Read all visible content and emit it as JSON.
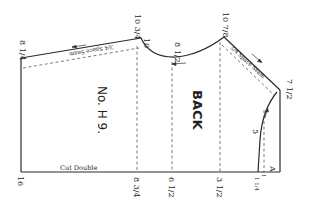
{
  "diagram": {
    "type": "sewing-pattern-piece",
    "piece_name": "BACK",
    "pattern_number": "No. H 9.",
    "fold_label": "Cut Double",
    "seam_labels": {
      "top_left_seam": "3/4 Space Seam",
      "shoulder_seam": "3/4 Space Seam"
    },
    "measurements": {
      "top_left": "8 1/4",
      "top_mid_left": "10 3/4",
      "top_mid_left_inner": "10",
      "neck_low": "8 1/2",
      "neck_high": "10 7/8",
      "right_top": "7 1/2",
      "curve_mark": "5",
      "bottom_left": "16",
      "bottom_1": "8 3/4",
      "bottom_2": "6 1/2",
      "bottom_3": "3 1/2",
      "bottom_4": "1 1/4",
      "bottom_5": "1",
      "corner_point": "A"
    },
    "colors": {
      "line": "#2a2a2a",
      "background": "#ffffff"
    }
  }
}
